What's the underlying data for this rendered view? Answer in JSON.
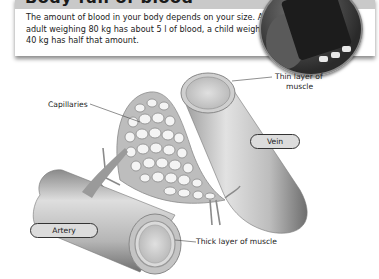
{
  "section": {
    "title": "Body full of blood",
    "text": "The amount of blood in your body depends on your size. An adult weighing 80 kg has about 5 l of blood, a child weighing 40 kg has half that amount."
  },
  "photo": {
    "subject": "blood-bag-photo"
  },
  "diagram": {
    "labels": {
      "capillaries": "Capillaries",
      "thin_muscle_line1": "Thin layer of",
      "thin_muscle_line2": "muscle",
      "vein": "Vein",
      "artery": "Artery",
      "thick_muscle": "Thick layer of muscle"
    }
  },
  "colors": {
    "header_band": "#c9c9c9",
    "pill_fill": "#dcdcdc",
    "pill_border": "#333333"
  }
}
